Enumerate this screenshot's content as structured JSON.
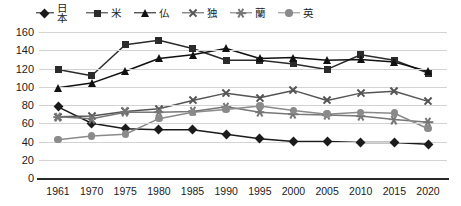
{
  "chart_data": {
    "type": "line",
    "title": "",
    "xlabel": "",
    "ylabel": "",
    "ylim": [
      0,
      160
    ],
    "ytick_step": 20,
    "grid": true,
    "legend_position": "top",
    "categories": [
      "1961",
      "1970",
      "1975",
      "1980",
      "1985",
      "1990",
      "1995",
      "2000",
      "2005",
      "2010",
      "2015",
      "2020"
    ],
    "yticks": [
      "0",
      "20",
      "40",
      "60",
      "80",
      "100",
      "120",
      "140",
      "160"
    ],
    "series": [
      {
        "name": "日本",
        "marker": "diamond",
        "color": "#1b1b1b",
        "values": [
          78,
          60,
          54,
          53,
          53,
          48,
          43,
          40,
          40,
          39,
          39,
          37
        ]
      },
      {
        "name": "米",
        "marker": "square",
        "color": "#2b2b2b",
        "values": [
          119,
          112,
          146,
          151,
          142,
          129,
          129,
          125,
          119,
          135,
          129,
          115
        ]
      },
      {
        "name": "仏",
        "marker": "triangle",
        "color": "#111111",
        "values": [
          99,
          104,
          117,
          131,
          135,
          142,
          131,
          132,
          129,
          130,
          127,
          117
        ]
      },
      {
        "name": "独",
        "marker": "x",
        "color": "#555555",
        "values": [
          67,
          68,
          73,
          76,
          85,
          93,
          88,
          96,
          85,
          93,
          95,
          84
        ]
      },
      {
        "name": "蘭",
        "marker": "star",
        "color": "#777777",
        "values": [
          67,
          65,
          72,
          72,
          73,
          78,
          72,
          70,
          69,
          68,
          64,
          61
        ]
      },
      {
        "name": "英",
        "marker": "circle",
        "color": "#8a8a8a",
        "values": [
          42,
          46,
          48,
          65,
          72,
          75,
          79,
          74,
          70,
          72,
          71,
          54
        ]
      }
    ]
  },
  "legend": {
    "items": [
      {
        "label": "日本"
      },
      {
        "label": "米"
      },
      {
        "label": "仏"
      },
      {
        "label": "独"
      },
      {
        "label": "蘭"
      },
      {
        "label": "英"
      }
    ]
  }
}
